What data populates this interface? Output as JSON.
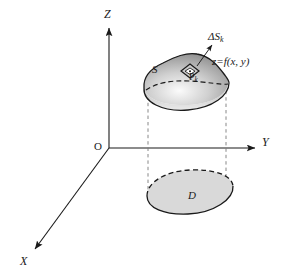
{
  "figure": {
    "background_color": "#ffffff",
    "stroke_color": "#1a1a1a",
    "dashed_color": "#6e6e6e"
  },
  "axes": {
    "z_label": "Z",
    "y_label": "Y",
    "x_label": "X",
    "origin_label": "O",
    "origin": {
      "x": 109,
      "y": 148
    },
    "z_tip": {
      "x": 109,
      "y": 25
    },
    "y_tip": {
      "x": 258,
      "y": 148
    },
    "x_tip": {
      "x": 32,
      "y": 252
    }
  },
  "surface": {
    "label": "S",
    "equation": "z=f(x, y)",
    "fill_top_color": "#8c8c8c",
    "fill_bottom_color": "#efefef",
    "edge_color": "#1a1a1a"
  },
  "patch": {
    "label_delta": "ΔS",
    "label_delta_sub": "k",
    "point_label": "P",
    "point_label_sub": "k"
  },
  "region": {
    "label": "D",
    "fill_color": "#d9d9d9",
    "edge_color": "#1a1a1a"
  },
  "projection_lines": {
    "left_x": 148,
    "right_x": 226,
    "top_y": 92,
    "bottom_y": 196
  }
}
